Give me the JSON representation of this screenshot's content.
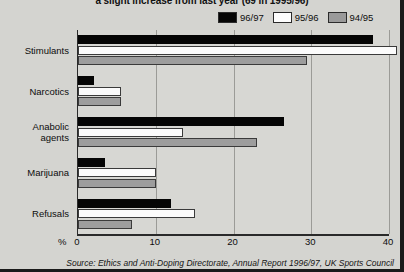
{
  "chart_data": {
    "type": "bar",
    "orientation": "horizontal",
    "title": "a slight increase from last year (69 in 1995/96)",
    "xlabel": "%",
    "ylabel": "",
    "xlim": [
      0,
      40
    ],
    "xticks": [
      0,
      10,
      20,
      30,
      40
    ],
    "grid": true,
    "legend_position": "top-right",
    "categories": [
      "Stimulants",
      "Narcotics",
      "Anabolic agents",
      "Marijuana",
      "Refusals"
    ],
    "series": [
      {
        "name": "96/97",
        "color": "#050505",
        "values": [
          38,
          2,
          26.5,
          3.5,
          12
        ]
      },
      {
        "name": "95/96",
        "color": "#fdfdfd",
        "values": [
          41,
          5.5,
          13.5,
          10,
          15
        ]
      },
      {
        "name": "94/95",
        "color": "#9a9a9a",
        "values": [
          29.5,
          5.5,
          23,
          10,
          7
        ]
      }
    ],
    "source": "Source: Ethics and Anti-Doping Directorate, Annual Report 1996/97, UK Sports Council"
  },
  "legend": {
    "items": [
      {
        "label": "96/97",
        "swatch": "black-swatch"
      },
      {
        "label": "95/96",
        "swatch": "white-swatch"
      },
      {
        "label": "94/95",
        "swatch": "gray-swatch"
      }
    ]
  },
  "axis": {
    "unit": "%",
    "ticks": [
      "0",
      "10",
      "20",
      "30",
      "40"
    ]
  },
  "categories": [
    {
      "line1": "Stimulants",
      "line2": ""
    },
    {
      "line1": "Narcotics",
      "line2": ""
    },
    {
      "line1": "Anabolic",
      "line2": "agents"
    },
    {
      "line1": "Marijuana",
      "line2": ""
    },
    {
      "line1": "Refusals",
      "line2": ""
    }
  ],
  "colors": {
    "series_9697": "#050505",
    "series_9596": "#fdfdfd",
    "series_9495": "#9a9a9a",
    "plot_background": "#d7d7d3",
    "page_background": "#d4d4d0",
    "axis": "#2a2a2a",
    "gridline": "#9b9b97"
  }
}
